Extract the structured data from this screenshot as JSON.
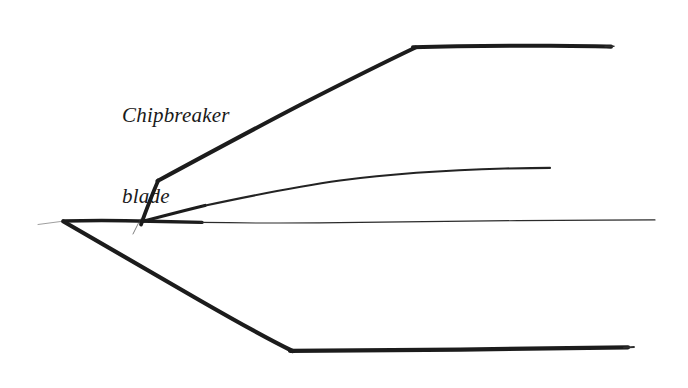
{
  "figure": {
    "title_visible": false,
    "background_color": "#ffffff",
    "ink_color": "#1c1c1c",
    "annotation": {
      "name": "chipbreaker-blade-label",
      "line1": "Chipbreaker",
      "line2": "blade",
      "style": "italic-serif",
      "x": 122,
      "y": 48
    },
    "strokes": [
      {
        "name": "blade-tip-whisker",
        "description": "faint hairline extending left from cutting edge apex",
        "weight": "hairline",
        "opacity": 0.5,
        "points": [
          [
            38,
            224
          ],
          [
            63,
            221
          ]
        ]
      },
      {
        "name": "cutting-edge-apex",
        "description": "sharp point where bevel and back meet",
        "x": 63,
        "y": 221
      },
      {
        "name": "blade-back-line",
        "description": "thick upper back edge of blade running right from apex",
        "weight": "thick",
        "points": [
          [
            63,
            221
          ],
          [
            110,
            220
          ],
          [
            150,
            221
          ],
          [
            200,
            222
          ]
        ]
      },
      {
        "name": "blade-back-hairline",
        "description": "thin continuation of back edge to the right end",
        "weight": "hairline",
        "points": [
          [
            200,
            222
          ],
          [
            320,
            223
          ],
          [
            430,
            221
          ],
          [
            540,
            220
          ],
          [
            655,
            220
          ]
        ]
      },
      {
        "name": "chipbreaker-riser",
        "description": "short steep rise from back edge up to chipbreaker kink",
        "weight": "thick",
        "points": [
          [
            141,
            223
          ],
          [
            150,
            200
          ],
          [
            158,
            180
          ]
        ]
      },
      {
        "name": "chipbreaker-riser-whisker",
        "description": "small tail below the chipbreaker junction",
        "weight": "hairline",
        "opacity": 0.6,
        "points": [
          [
            140,
            220
          ],
          [
            133,
            234
          ]
        ]
      },
      {
        "name": "chipbreaker-upper-diagonal",
        "description": "long diagonal of chipbreaker blade rising to the right",
        "weight": "thick",
        "points": [
          [
            158,
            180
          ],
          [
            250,
            132
          ],
          [
            340,
            86
          ],
          [
            415,
            47
          ]
        ]
      },
      {
        "name": "chipbreaker-top-flat",
        "description": "near horizontal top of chipbreaker blade",
        "weight": "thick",
        "points": [
          [
            415,
            47
          ],
          [
            500,
            46
          ],
          [
            560,
            46
          ],
          [
            612,
            46
          ]
        ]
      },
      {
        "name": "shaving-curve",
        "description": "thin curved line of the shaving rising from the throat",
        "weight": "thin",
        "points": [
          [
            142,
            221
          ],
          [
            200,
            206
          ],
          [
            280,
            189
          ],
          [
            360,
            179
          ],
          [
            450,
            172
          ],
          [
            548,
            168
          ]
        ]
      },
      {
        "name": "bevel-lower-diagonal",
        "description": "thick lower bevel descending right from apex",
        "weight": "thick",
        "points": [
          [
            63,
            221
          ],
          [
            150,
            271
          ],
          [
            230,
            318
          ],
          [
            292,
            350
          ]
        ]
      },
      {
        "name": "bevel-lower-flat",
        "description": "thick near horizontal lower edge extending right",
        "weight": "thick",
        "points": [
          [
            292,
            350
          ],
          [
            400,
            350
          ],
          [
            520,
            349
          ],
          [
            633,
            347
          ]
        ]
      }
    ]
  }
}
